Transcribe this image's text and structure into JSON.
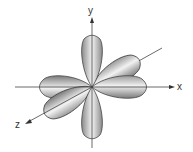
{
  "diagram": {
    "type": "orbital-lobes-3d-axes",
    "axes": {
      "x": {
        "label": "x"
      },
      "y": {
        "label": "y"
      },
      "z": {
        "label": "z"
      }
    },
    "lobe_count": 6,
    "colors": {
      "lobe_fill_light": "#f4f4f4",
      "lobe_fill_dark": "#8a8a8a",
      "lobe_stroke": "#333333",
      "axis": "#444444"
    }
  }
}
